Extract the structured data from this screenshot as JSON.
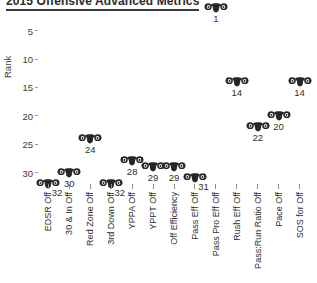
{
  "title": "2015 Offensive Advanced Metrics",
  "axes": {
    "ylabel": "Rank",
    "yticks": [
      "5",
      "10",
      "15",
      "20",
      "25",
      "30"
    ]
  },
  "marker": {
    "icon_name": "rams-head-logo-icon",
    "color": "#262626"
  },
  "chart_data": {
    "type": "scatter",
    "title": "2015 Offensive Advanced Metrics",
    "xlabel": "",
    "ylabel": "Rank",
    "ylim": [
      32,
      1
    ],
    "y_inverted": true,
    "grid": false,
    "legend": "none",
    "categories": [
      "EDSR Off",
      "30 & In Off",
      "Red Zone Off",
      "3rd Down Off",
      "YPPA Off",
      "YPPT Off",
      "Off Efficiency",
      "Pass Eff Off",
      "Pass Pro Eff Off",
      "Rush Eff Off",
      "Pass:Run Ratio Off",
      "Pace Off",
      "SOS for Off"
    ],
    "values": [
      32,
      30,
      24,
      32,
      28,
      29,
      29,
      31,
      1,
      14,
      22,
      20,
      14
    ],
    "point_labels": [
      "32",
      "30",
      "24",
      "32",
      "28",
      "29",
      "29",
      "31",
      "1",
      "14",
      "22",
      "20",
      "14"
    ]
  }
}
